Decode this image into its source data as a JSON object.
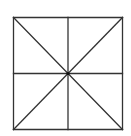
{
  "diagram": {
    "type": "geometric-figure",
    "stroke_color": "#333333",
    "background_color": "#ffffff",
    "square": {
      "x1": 13.5,
      "y1": 17.5,
      "x2": 122.5,
      "y2": 129.5
    },
    "center": {
      "x": 68,
      "y": 73.5
    },
    "segments": [
      {
        "name": "top-edge",
        "x1": 13.5,
        "y1": 17.5,
        "x2": 122.5,
        "y2": 17.5
      },
      {
        "name": "right-edge",
        "x1": 122.5,
        "y1": 17.5,
        "x2": 122.5,
        "y2": 129.5
      },
      {
        "name": "bottom-edge",
        "x1": 13.5,
        "y1": 129.5,
        "x2": 122.5,
        "y2": 129.5
      },
      {
        "name": "left-edge",
        "x1": 13.5,
        "y1": 17.5,
        "x2": 13.5,
        "y2": 129.5
      },
      {
        "name": "vertical-midline",
        "x1": 68,
        "y1": 17.5,
        "x2": 68,
        "y2": 129.5
      },
      {
        "name": "horizontal-midline",
        "x1": 13.5,
        "y1": 73.5,
        "x2": 122.5,
        "y2": 73.5
      },
      {
        "name": "diagonal-main",
        "x1": 13.5,
        "y1": 17.5,
        "x2": 122.5,
        "y2": 129.5
      },
      {
        "name": "diagonal-anti",
        "x1": 122.5,
        "y1": 17.5,
        "x2": 13.5,
        "y2": 129.5
      }
    ]
  }
}
